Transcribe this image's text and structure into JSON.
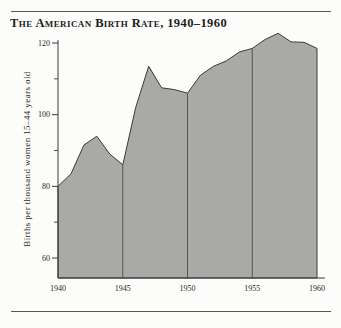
{
  "figure": {
    "title": "The American Birth Rate, 1940–1960"
  },
  "chart_data": {
    "type": "area",
    "title": "The American Birth Rate, 1940–1960",
    "xlabel": "",
    "ylabel": "Births per thousand women 15–44 years old",
    "x": [
      1940,
      1941,
      1942,
      1943,
      1944,
      1945,
      1946,
      1947,
      1948,
      1949,
      1950,
      1951,
      1952,
      1953,
      1954,
      1955,
      1956,
      1957,
      1958,
      1959,
      1960
    ],
    "values": [
      80,
      83.5,
      91.5,
      94,
      89,
      86,
      102,
      113.5,
      107.5,
      107,
      106,
      111,
      113.5,
      115,
      117.5,
      118.5,
      121,
      122.7,
      120.3,
      120.2,
      118.5
    ],
    "x_ticks": [
      1940,
      1945,
      1950,
      1955,
      1960
    ],
    "y_ticks_major": [
      60,
      80,
      100,
      120
    ],
    "y_ticks_minor": [
      70,
      90,
      110
    ],
    "grid_x_years": [
      1945,
      1950,
      1955
    ],
    "xlim": [
      1940,
      1960
    ],
    "ylim": [
      54,
      123
    ],
    "grid": "vertical-only",
    "legend": "none",
    "fill_color": "#a9a9a7",
    "line_color": "#3a3a38",
    "grid_color": "#4a4a48"
  }
}
